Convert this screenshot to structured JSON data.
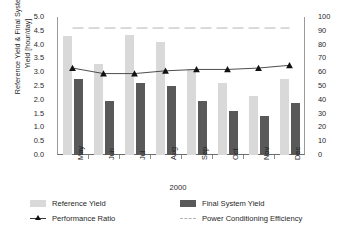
{
  "chart_data": {
    "type": "bar",
    "title": "",
    "xlabel": "2000",
    "ylabel": "Reference Yield & Final System\nYield [hour/day]",
    "ylabel_right": "",
    "categories": [
      "May",
      "Jun",
      "Jul",
      "Aug",
      "Sep",
      "Oct",
      "Nov",
      "Dec"
    ],
    "ylim": [
      0,
      5
    ],
    "ylim_right": [
      0,
      100
    ],
    "yticks": [
      "0.0",
      "0.5",
      "1.0",
      "1.5",
      "2.0",
      "2.5",
      "3.0",
      "3.5",
      "4.0",
      "4.5",
      "5.0"
    ],
    "yticks_right": [
      "0",
      "10",
      "20",
      "30",
      "40",
      "50",
      "60",
      "70",
      "80",
      "90",
      "100"
    ],
    "grid": false,
    "legend_position": "bottom",
    "series": [
      {
        "name": "Reference Yield",
        "type": "bar",
        "axis": "left",
        "color": "#d9d9d9",
        "values": [
          4.3,
          3.3,
          4.35,
          4.1,
          3.1,
          2.6,
          2.15,
          2.75
        ]
      },
      {
        "name": "Final System Yield",
        "type": "bar",
        "axis": "left",
        "color": "#595959",
        "values": [
          2.75,
          1.95,
          2.6,
          2.5,
          1.95,
          1.6,
          1.4,
          1.9
        ]
      },
      {
        "name": "Performance Ratio",
        "type": "line",
        "axis": "right",
        "color": "#3a3a3a",
        "marker": "triangle",
        "values": [
          63,
          59,
          59,
          61,
          62,
          62,
          63,
          65
        ]
      },
      {
        "name": "Power Conditioning Efficiency",
        "type": "line",
        "axis": "right",
        "color": "#b4b4b4",
        "style": "dashed",
        "values": [
          92,
          92,
          92,
          92,
          92,
          92,
          92,
          92
        ]
      }
    ]
  },
  "legend": {
    "items": [
      {
        "label": "Reference Yield",
        "swatch": "ref"
      },
      {
        "label": "Final System Yield",
        "swatch": "fin"
      },
      {
        "label": "Performance Ratio",
        "swatch": "line"
      },
      {
        "label": "Power Conditioning Efficiency",
        "swatch": "dash"
      }
    ]
  }
}
